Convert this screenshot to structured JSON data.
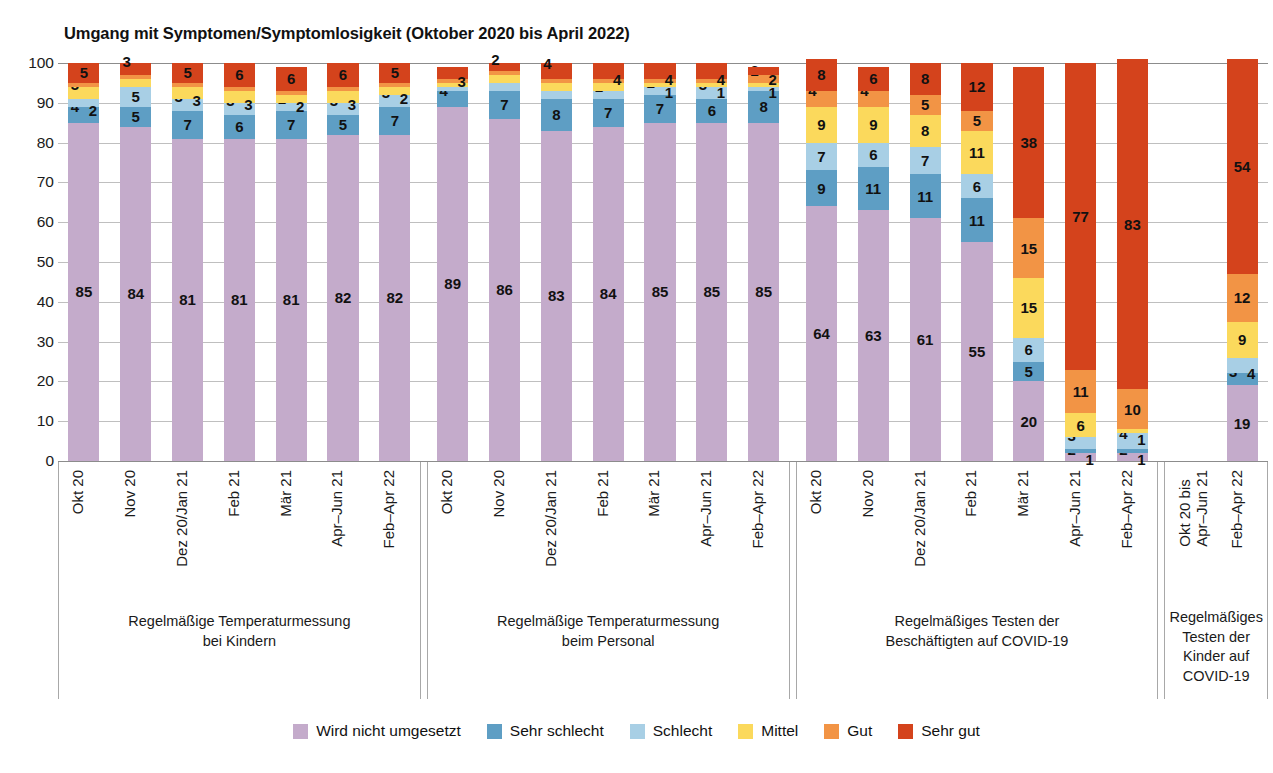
{
  "chart_data": {
    "type": "bar",
    "subtype": "stacked-bar-100-percent-grouped",
    "title": "Umgang mit Symptomen/Symptomlosigkeit (Oktober 2020 bis April 2022)",
    "xlabel": "",
    "ylabel": "",
    "ylim": [
      0,
      100
    ],
    "yticks": [
      0,
      10,
      20,
      30,
      40,
      50,
      60,
      70,
      80,
      90,
      100
    ],
    "grid": true,
    "legend_position": "bottom",
    "series": [
      {
        "name": "Wird nicht umgesetzt",
        "color": "#c4abcb"
      },
      {
        "name": "Sehr schlecht",
        "color": "#5e9ec4"
      },
      {
        "name": "Schlecht",
        "color": "#a8cfe5"
      },
      {
        "name": "Mittel",
        "color": "#fbd95c"
      },
      {
        "name": "Gut",
        "color": "#f29445"
      },
      {
        "name": "Sehr gut",
        "color": "#d4431c"
      }
    ],
    "groups": [
      {
        "title": "Regelmäßige Temperaturmessung\nbei Kindern",
        "bars": [
          {
            "x": "Okt 20",
            "values": [
              85,
              4,
              2,
              3,
              1,
              5
            ],
            "shown": [
              "85",
              "4",
              "2",
              "3",
              "",
              "5"
            ]
          },
          {
            "x": "Nov 20",
            "values": [
              84,
              5,
              5,
              2,
              1,
              3
            ],
            "shown": [
              "84",
              "5",
              "5",
              "",
              "",
              "3"
            ]
          },
          {
            "x": "Dez 20/Jan 21",
            "values": [
              81,
              7,
              3,
              3,
              1,
              5
            ],
            "shown": [
              "81",
              "7",
              "3",
              "3",
              "",
              "5"
            ]
          },
          {
            "x": "Feb 21",
            "values": [
              81,
              6,
              3,
              3,
              1,
              6
            ],
            "shown": [
              "81",
              "6",
              "3",
              "3",
              "",
              "6"
            ]
          },
          {
            "x": "Mär 21",
            "values": [
              81,
              7,
              2,
              2,
              1,
              6
            ],
            "shown": [
              "81",
              "7",
              "2",
              "2",
              "1",
              "6"
            ]
          },
          {
            "x": "Apr–Jun 21",
            "values": [
              82,
              5,
              3,
              3,
              1,
              6
            ],
            "shown": [
              "82",
              "5",
              "3",
              "3",
              "1",
              "6"
            ]
          },
          {
            "x": "Feb–Apr 22",
            "values": [
              82,
              7,
              3,
              2,
              1,
              5
            ],
            "shown": [
              "82",
              "7",
              "3",
              "2",
              "1",
              "5"
            ]
          }
        ]
      },
      {
        "title": "Regelmäßige Temperaturmessung\nbeim Personal",
        "bars": [
          {
            "x": "Okt 20",
            "values": [
              89,
              4,
              1,
              1,
              1,
              3
            ],
            "shown": [
              "89",
              "4",
              "",
              "",
              "",
              "3"
            ]
          },
          {
            "x": "Nov 20",
            "values": [
              86,
              7,
              2,
              2,
              1,
              2
            ],
            "shown": [
              "86",
              "7",
              "",
              "",
              "",
              "2"
            ]
          },
          {
            "x": "Dez 20/Jan 21",
            "values": [
              83,
              8,
              2,
              2,
              1,
              4
            ],
            "shown": [
              "83",
              "8",
              "",
              "",
              "",
              "4"
            ]
          },
          {
            "x": "Feb 21",
            "values": [
              84,
              7,
              2,
              2,
              1,
              4
            ],
            "shown": [
              "84",
              "7",
              "2",
              "",
              "",
              "4"
            ]
          },
          {
            "x": "Mär 21",
            "values": [
              85,
              7,
              2,
              1,
              1,
              4
            ],
            "shown": [
              "85",
              "7",
              "2",
              "1",
              "1",
              "4"
            ]
          },
          {
            "x": "Apr–Jun 21",
            "values": [
              85,
              6,
              3,
              1,
              1,
              4
            ],
            "shown": [
              "85",
              "6",
              "3",
              "1",
              "1",
              "4"
            ]
          },
          {
            "x": "Feb–Apr 22",
            "values": [
              85,
              8,
              1,
              1,
              2,
              2
            ],
            "shown": [
              "85",
              "8",
              "1",
              "1",
              "2",
              "2"
            ]
          }
        ]
      },
      {
        "title": "Regelmäßiges Testen der\nBeschäftigten auf COVID-19",
        "bars": [
          {
            "x": "Okt 20",
            "values": [
              64,
              9,
              7,
              9,
              4,
              8
            ],
            "shown": [
              "64",
              "9",
              "7",
              "9",
              "4",
              "8"
            ]
          },
          {
            "x": "Nov 20",
            "values": [
              63,
              11,
              6,
              9,
              4,
              6
            ],
            "shown": [
              "63",
              "11",
              "6",
              "9",
              "4",
              "6"
            ]
          },
          {
            "x": "Dez 20/Jan 21",
            "values": [
              61,
              11,
              7,
              8,
              5,
              8
            ],
            "shown": [
              "61",
              "11",
              "7",
              "8",
              "5",
              "8"
            ]
          },
          {
            "x": "Feb 21",
            "values": [
              55,
              11,
              6,
              11,
              5,
              12
            ],
            "shown": [
              "55",
              "11",
              "6",
              "11",
              "5",
              "12"
            ]
          },
          {
            "x": "Mär 21",
            "values": [
              20,
              5,
              6,
              15,
              15,
              38
            ],
            "shown": [
              "20",
              "5",
              "6",
              "15",
              "15",
              "38"
            ]
          },
          {
            "x": "Apr–Jun 21",
            "values": [
              2,
              1,
              3,
              6,
              11,
              77
            ],
            "shown": [
              "2",
              "1",
              "3",
              "6",
              "11",
              "77"
            ]
          },
          {
            "x": "Feb–Apr 22",
            "values": [
              2,
              1,
              4,
              1,
              10,
              83
            ],
            "shown": [
              "2",
              "1",
              "4",
              "1",
              "10",
              "83"
            ]
          }
        ]
      },
      {
        "title": "Regelmäßiges\nTesten der\nKinder auf\nCOVID-19",
        "bars": [
          {
            "x": "Okt 20 bis\nApr–Jun 21",
            "values": [
              0,
              0,
              0,
              0,
              0,
              0
            ],
            "shown": [
              "",
              "",
              "",
              "",
              "",
              ""
            ]
          },
          {
            "x": "Feb–Apr 22",
            "values": [
              19,
              3,
              4,
              9,
              12,
              54
            ],
            "shown": [
              "19",
              "3",
              "4",
              "9",
              "12",
              "54"
            ]
          }
        ]
      }
    ]
  },
  "legend": {
    "items": [
      {
        "label": "Wird nicht umgesetzt",
        "color": "#c4abcb"
      },
      {
        "label": "Sehr schlecht",
        "color": "#5e9ec4"
      },
      {
        "label": "Schlecht",
        "color": "#a8cfe5"
      },
      {
        "label": "Mittel",
        "color": "#fbd95c"
      },
      {
        "label": "Gut",
        "color": "#f29445"
      },
      {
        "label": "Sehr gut",
        "color": "#d4431c"
      }
    ]
  }
}
